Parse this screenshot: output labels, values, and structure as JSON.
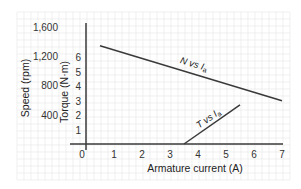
{
  "chart_data": {
    "type": "line",
    "title": "",
    "xlabel": "Armature current (A)",
    "ylabel_left_outer": "Speed (rpm)",
    "ylabel_left_inner": "Torque (N·m)",
    "x_ticks": [
      "0",
      "1",
      "2",
      "3",
      "4",
      "5",
      "6",
      "7"
    ],
    "x_range": [
      0,
      7
    ],
    "speed_ticks": [
      "400",
      "800",
      "1,200",
      "1,600"
    ],
    "speed_range": [
      0,
      1600
    ],
    "torque_ticks": [
      "1",
      "2",
      "3",
      "4",
      "5",
      "6"
    ],
    "torque_range": [
      0,
      6
    ],
    "grid": true,
    "series": [
      {
        "name": "N vs Ia",
        "label_main": "N vs I",
        "label_sub": "a",
        "axis": "speed",
        "points": [
          [
            0.5,
            1340
          ],
          [
            7.0,
            590
          ]
        ]
      },
      {
        "name": "T vs Ia",
        "label_main": "T vs I",
        "label_sub": "a",
        "axis": "torque",
        "points": [
          [
            3.5,
            0
          ],
          [
            5.5,
            2.7
          ]
        ]
      }
    ]
  },
  "colors": {
    "axis": "#3a3a3a",
    "line": "#3a3a3a",
    "grid": "#e6e6e6",
    "text": "#333333"
  }
}
